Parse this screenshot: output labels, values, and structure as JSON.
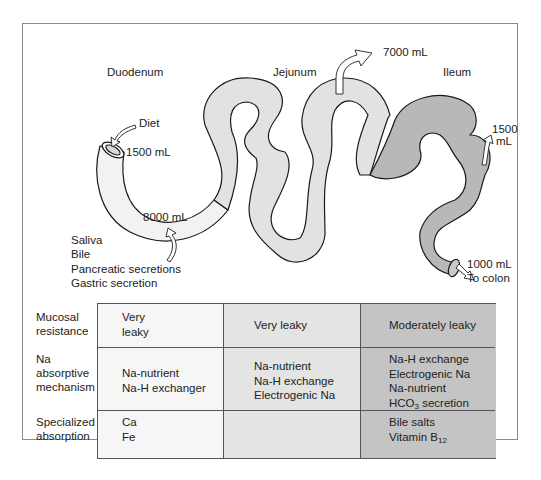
{
  "diagram": {
    "segments": [
      {
        "name": "Duodenum",
        "color": "#f2f2f2"
      },
      {
        "name": "Jejunum",
        "color": "#e2e2e2"
      },
      {
        "name": "Ileum",
        "color": "#b8b8b8"
      }
    ],
    "flows": {
      "diet_label": "Diet",
      "diet_volume": "1500 mL",
      "secretions_volume": "8000 mL",
      "secretions": [
        "Saliva",
        "Bile",
        "Pancreatic secretions",
        "Gastric secretion"
      ],
      "jejunum_absorbed": "7000 mL",
      "ileum_absorbed_line1": "1500",
      "ileum_absorbed_line2": "mL",
      "to_colon_volume": "1000 mL",
      "to_colon_label": "To colon"
    }
  },
  "table": {
    "row_labels": [
      [
        "Mucosal",
        "resistance"
      ],
      [
        "Na",
        "absorptive",
        "mechanism"
      ],
      [
        "Specialized",
        "absorption"
      ]
    ],
    "columns": [
      {
        "segment": "Duodenum",
        "color": "#f6f6f6",
        "mucosal_resistance": [
          "Very",
          "leaky"
        ],
        "na_mechanism": [
          "Na-nutrient",
          "Na-H exchanger"
        ],
        "specialized_absorption": [
          "Ca",
          "Fe"
        ]
      },
      {
        "segment": "Jejunum",
        "color": "#e4e4e4",
        "mucosal_resistance": [
          "Very leaky"
        ],
        "na_mechanism": [
          "Na-nutrient",
          "Na-H exchange",
          "Electrogenic Na"
        ],
        "specialized_absorption": []
      },
      {
        "segment": "Ileum",
        "color": "#c4c4c4",
        "mucosal_resistance": [
          "Moderately leaky"
        ],
        "na_mechanism": [
          "Na-H exchange",
          "Electrogenic Na",
          "Na-nutrient",
          "HCO",
          "3",
          " secretion"
        ],
        "specialized_absorption": [
          "Bile salts",
          "Vitamin B",
          "12"
        ]
      }
    ]
  }
}
